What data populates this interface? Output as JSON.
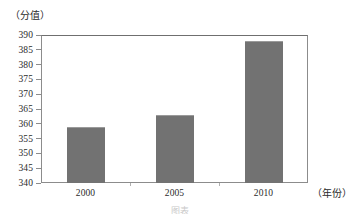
{
  "chart_data": {
    "type": "bar",
    "title": "",
    "subtitle": "",
    "xlabel": "（年份）",
    "ylabel": "（分值）",
    "categories": [
      "2000",
      "2005",
      "2010"
    ],
    "values": [
      359,
      363,
      388
    ],
    "series": [
      {
        "name": "分值",
        "values": [
          359,
          363,
          388
        ]
      }
    ],
    "ylim": [
      340,
      390
    ],
    "ytick_step": 5,
    "ytick_labels": [
      "390",
      "385",
      "380",
      "375",
      "370",
      "365",
      "360",
      "355",
      "350",
      "345",
      "340"
    ],
    "ytick_values": [
      390,
      385,
      380,
      375,
      370,
      365,
      360,
      355,
      350,
      345,
      340
    ],
    "xtick_labels": [
      "2000",
      "2005",
      "2010"
    ],
    "grid": false,
    "legend": false,
    "legend_position": "none",
    "annotations": [],
    "bar_color": "#727272",
    "frame_color": "#8c8c8c",
    "background_color": "#ffffff"
  },
  "caption": {
    "bottom_partial": "图表"
  }
}
